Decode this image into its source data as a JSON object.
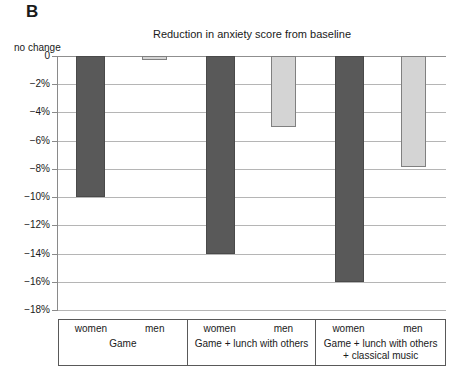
{
  "panel": {
    "letter": "B"
  },
  "title": "Reduction in anxiety score from baseline",
  "annotation": {
    "no_change": "no change"
  },
  "axis": {
    "ticks": [
      "0",
      "−2%",
      "−4%",
      "−6%",
      "−8%",
      "−10%",
      "−12%",
      "−14%",
      "−16%",
      "−18%"
    ]
  },
  "groups": [
    {
      "name_line1": "Game",
      "name_line2": "",
      "women_label": "women",
      "men_label": "men"
    },
    {
      "name_line1": "Game + lunch with others",
      "name_line2": "",
      "women_label": "women",
      "men_label": "men"
    },
    {
      "name_line1": "Game + lunch with others",
      "name_line2": "+ classical music",
      "women_label": "women",
      "men_label": "men"
    }
  ],
  "colors": {
    "women_bar": "#595959",
    "men_bar": "#d4d4d4",
    "men_bar_border": "#808080",
    "gridline": "#b5b5b5",
    "axis": "#8a8a8a"
  },
  "chart_data": {
    "type": "bar",
    "title": "Reduction in anxiety score from baseline",
    "xlabel": "",
    "ylabel": "",
    "ylim": [
      -18,
      0
    ],
    "ytick_values": [
      0,
      -2,
      -4,
      -6,
      -8,
      -10,
      -12,
      -14,
      -16,
      -18
    ],
    "ytick_labels": [
      "0",
      "−2%",
      "−4%",
      "−6%",
      "−8%",
      "−10%",
      "−12%",
      "−14%",
      "−16%",
      "−18%"
    ],
    "grid": true,
    "legend": "none",
    "annotations": [
      "no change"
    ],
    "categories": [
      "Game",
      "Game + lunch with others",
      "Game + lunch with others + classical music"
    ],
    "series": [
      {
        "name": "women",
        "values": [
          -10.0,
          -14.0,
          -16.0
        ]
      },
      {
        "name": "men",
        "values": [
          -0.3,
          -5.0,
          -7.9
        ]
      }
    ]
  }
}
